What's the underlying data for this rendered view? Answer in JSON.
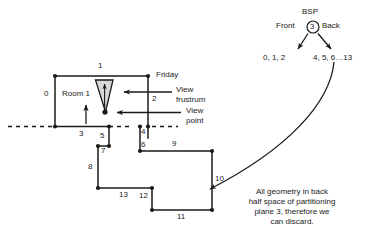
{
  "figure": {
    "room_label": "Room 1",
    "friday_label": "Friday",
    "frustum_label_line1": "View",
    "frustum_label_line2": "frustrum",
    "viewpoint_label_line1": "View",
    "viewpoint_label_line2": "point",
    "edge_numbers": {
      "n0": "0",
      "n1": "1",
      "n2": "2",
      "n3": "3",
      "n4": "4",
      "n5": "5",
      "n6": "6",
      "n7": "7",
      "n8": "8",
      "n9": "9",
      "n10": "10",
      "n11": "11",
      "n12": "12",
      "n13": "13"
    }
  },
  "bsp_tree": {
    "title": "BSP",
    "front_label": "Front",
    "back_label": "Back",
    "root_node": "3",
    "front_leaf": "0, 1, 2",
    "back_leaf": "4, 5, 6…13"
  },
  "annotation": {
    "line1": "All geometry in back",
    "line2": "half space of partitioning",
    "line3": "plane 3, therefore we",
    "line4": "can discard."
  },
  "colors": {
    "ink": "#1a1a1a",
    "frustum_fill": "#d9d9d9",
    "background": "#ffffff"
  }
}
